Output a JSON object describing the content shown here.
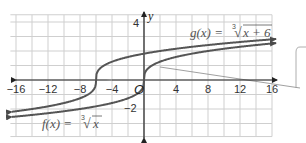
{
  "chart_data": {
    "type": "line",
    "title": "",
    "xlabel": "x",
    "ylabel": "y",
    "xlim": [
      -17,
      17
    ],
    "ylim": [
      -4,
      4
    ],
    "grid": true,
    "x_ticks": [
      -16,
      -12,
      -8,
      -4,
      4,
      8,
      12,
      16
    ],
    "x_tick_labels": [
      "−16",
      "−12",
      "−8",
      "−4",
      "4",
      "8",
      "12",
      "16"
    ],
    "y_ticks": [
      4,
      -2
    ],
    "y_tick_labels": [
      "4",
      "−2"
    ],
    "origin_label": "O",
    "series": [
      {
        "name": "f(x) = ∛x",
        "label_text": "f(x) = ∛x",
        "expression": "cbrt(x)",
        "color": "#5a5a5a",
        "x": [
          -17,
          -16,
          -12,
          -8,
          -4,
          -1,
          0,
          1,
          4,
          8,
          12,
          16
        ],
        "y": [
          -2.57,
          -2.52,
          -2.29,
          -2,
          -1.59,
          -1,
          0,
          1,
          1.59,
          2,
          2.29,
          2.52
        ]
      },
      {
        "name": "g(x) = ∛(x + 6)",
        "label_text": "g(x) = ∛(x + 6)",
        "expression": "cbrt(x+6)",
        "color": "#5a5a5a",
        "x": [
          -17,
          -14,
          -10,
          -7,
          -6,
          -5,
          -2,
          2,
          6,
          10,
          16
        ],
        "y": [
          -2.22,
          -2,
          -1.59,
          -1,
          0,
          1,
          1.59,
          2,
          2.29,
          2.52,
          2.8
        ]
      }
    ],
    "annotations": [
      {
        "text": "f(x) = ∛x",
        "near": "lower-left"
      },
      {
        "text": "g(x) = ∛(x + 6)",
        "near": "upper-right"
      },
      {
        "type": "callout-box",
        "position": "right edge, partially visible"
      }
    ]
  },
  "labels": {
    "y_axis": "y",
    "origin": "O",
    "f_label": "f(x) = ",
    "f_rad": "x",
    "g_label": "g(x) = ",
    "g_rad": "x + 6",
    "cube_index": "3",
    "y4": "4",
    "ym2": "−2"
  }
}
